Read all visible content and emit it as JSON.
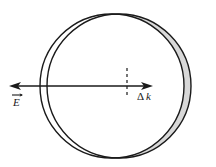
{
  "figure": {
    "background_color": "#ffffff",
    "stroke_color": "#1a1a1a",
    "shade_color": "#d8d8d8",
    "width": 216,
    "height": 167
  },
  "labels": {
    "field_label": "E",
    "field_accent": "vector-arrow-overbar",
    "shift_label_delta": "Δ",
    "shift_label_k": "k",
    "shift_label_full": "Δk"
  },
  "geometry": {
    "undisplaced_circle": {
      "name": "equilibrium-fermi-circle",
      "cx": 112,
      "cy": 86,
      "r": 72,
      "fill": "#ffffff",
      "stroke": "#1a1a1a",
      "stroke_width": 1.4
    },
    "displaced_circle": {
      "name": "displaced-fermi-circle",
      "cx": 119,
      "cy": 86,
      "r": 72,
      "fill": "#ffffff",
      "stroke": "#1a1a1a",
      "stroke_width": 1.4
    },
    "shaded_lune": {
      "name": "excess-population-crescent",
      "fill": "#d8d8d8",
      "stroke": "#1a1a1a",
      "stroke_width": 1.2,
      "description": "crescent between the two circle outlines on the right side"
    },
    "axis_arrow": {
      "name": "horizontal-double-arrow",
      "x_start": 10,
      "x_end": 152,
      "y": 86,
      "stroke_width": 1.3,
      "arrowheads": "both"
    },
    "dashed_tick": {
      "name": "center-dashed-tick",
      "x": 127,
      "y_top": 68,
      "y_bottom": 97,
      "dash": "3 3",
      "stroke_width": 1.2
    }
  }
}
